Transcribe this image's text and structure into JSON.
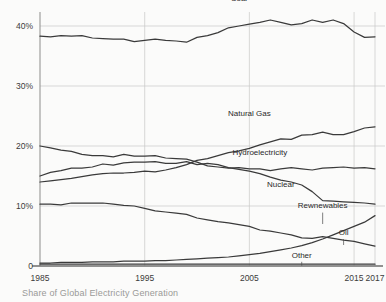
{
  "caption": "Share of Global Electricity Generation",
  "chart_data": {
    "type": "line",
    "title": "",
    "subtitle": "",
    "caption": "Share of Global Electricity Generation",
    "xlabel": "",
    "ylabel": "",
    "xlim": [
      1985,
      2017
    ],
    "ylim": [
      0,
      42
    ],
    "grid": true,
    "legend_position": "inline-labels",
    "y_ticks": [
      {
        "value": 0,
        "label": "0"
      },
      {
        "value": 10,
        "label": "10%"
      },
      {
        "value": 20,
        "label": "20%"
      },
      {
        "value": 30,
        "label": "30%"
      },
      {
        "value": 40,
        "label": "40%"
      }
    ],
    "x_ticks": [
      {
        "value": 1985,
        "label": "1985"
      },
      {
        "value": 1995,
        "label": "1995"
      },
      {
        "value": 2005,
        "label": "2005"
      },
      {
        "value": 2015,
        "label": "2015"
      },
      {
        "value": 2017,
        "label": "2017"
      }
    ],
    "x": [
      1985,
      1986,
      1987,
      1988,
      1989,
      1990,
      1991,
      1992,
      1993,
      1994,
      1995,
      1996,
      1997,
      1998,
      1999,
      2000,
      2001,
      2002,
      2003,
      2004,
      2005,
      2006,
      2007,
      2008,
      2009,
      2010,
      2011,
      2012,
      2013,
      2014,
      2015,
      2016,
      2017
    ],
    "series": [
      {
        "name": "Coal",
        "label": "Coal",
        "label_x": 2004,
        "label_y": 44.2,
        "color": "#3a3a3a",
        "values": [
          38.3,
          38.2,
          38.4,
          38.3,
          38.4,
          38.0,
          37.9,
          37.8,
          37.8,
          37.4,
          37.6,
          37.8,
          37.6,
          37.5,
          37.3,
          38.1,
          38.4,
          38.9,
          39.7,
          40.0,
          40.3,
          40.6,
          41.0,
          40.6,
          40.2,
          40.4,
          41.0,
          40.6,
          41.0,
          40.4,
          39.0,
          38.1,
          38.2
        ],
        "endpoint": {
          "year": 2017,
          "value": 38.2
        }
      },
      {
        "name": "Natural Gas",
        "label": "Natural Gas",
        "label_x": 2005,
        "label_y": 25.0,
        "color": "#3a3a3a",
        "values": [
          14.0,
          14.2,
          14.4,
          14.6,
          14.9,
          15.2,
          15.4,
          15.5,
          15.5,
          15.6,
          15.8,
          15.7,
          16.0,
          16.4,
          16.9,
          17.6,
          17.9,
          18.4,
          18.9,
          19.2,
          19.6,
          20.2,
          20.7,
          21.2,
          21.1,
          21.8,
          21.9,
          22.3,
          21.9,
          21.9,
          22.4,
          23.0,
          23.2
        ],
        "endpoint": {
          "year": 2017,
          "value": 23.2
        }
      },
      {
        "name": "Hydroelectricity",
        "label": "Hydroelectricity",
        "label_x": 2006,
        "label_y": 18.5,
        "color": "#3a3a3a",
        "values": [
          20.0,
          19.7,
          19.3,
          19.1,
          18.6,
          18.4,
          18.4,
          18.2,
          18.6,
          18.3,
          18.3,
          18.4,
          18.0,
          17.9,
          17.8,
          17.3,
          16.7,
          16.5,
          16.3,
          16.4,
          16.2,
          16.2,
          15.9,
          16.2,
          16.4,
          16.2,
          16.0,
          16.3,
          16.4,
          16.5,
          16.3,
          16.4,
          16.2
        ],
        "endpoint": {
          "year": 2017,
          "value": 16.2
        }
      },
      {
        "name": "Nuclear",
        "label": "Nuclear",
        "label_x": 2008,
        "label_y": 13.2,
        "color": "#3a3a3a",
        "values": [
          15.0,
          15.6,
          15.9,
          16.3,
          16.3,
          16.5,
          17.0,
          16.8,
          17.2,
          17.3,
          17.3,
          17.4,
          17.1,
          17.1,
          17.4,
          16.9,
          17.1,
          16.9,
          16.4,
          16.1,
          15.8,
          15.4,
          14.8,
          14.3,
          14.0,
          13.5,
          12.4,
          10.9,
          10.8,
          10.7,
          10.6,
          10.5,
          10.3
        ],
        "endpoint": {
          "year": 2017,
          "value": 10.3
        }
      },
      {
        "name": "Oil",
        "label": "Oil",
        "label_x": 2014,
        "label_y": 5.2,
        "color": "#3a3a3a",
        "values": [
          10.3,
          10.3,
          10.2,
          10.5,
          10.5,
          10.5,
          10.5,
          10.3,
          10.1,
          10.0,
          9.6,
          9.2,
          9.0,
          8.8,
          8.6,
          8.0,
          7.7,
          7.4,
          7.2,
          6.9,
          6.6,
          6.0,
          5.8,
          5.5,
          5.2,
          4.7,
          4.6,
          4.9,
          4.6,
          4.3,
          4.1,
          3.7,
          3.3
        ],
        "endpoint": {
          "year": 2017,
          "value": 3.3
        }
      },
      {
        "name": "Rewnewables",
        "label": "Rewnewables",
        "label_x": 2012,
        "label_y": 9.6,
        "color": "#3a3a3a",
        "values": [
          0.5,
          0.5,
          0.6,
          0.6,
          0.6,
          0.7,
          0.7,
          0.7,
          0.8,
          0.8,
          0.8,
          0.9,
          0.9,
          1.0,
          1.1,
          1.2,
          1.3,
          1.4,
          1.5,
          1.7,
          1.9,
          2.1,
          2.4,
          2.7,
          3.0,
          3.4,
          3.9,
          4.5,
          5.2,
          5.9,
          6.6,
          7.3,
          8.4
        ],
        "endpoint": {
          "year": 2017,
          "value": 8.4
        }
      },
      {
        "name": "Other",
        "label": "Other",
        "label_x": 2010,
        "label_y": 1.3,
        "color": "#3a3a3a",
        "values": [
          0.3,
          0.3,
          0.3,
          0.3,
          0.3,
          0.3,
          0.3,
          0.3,
          0.3,
          0.3,
          0.3,
          0.3,
          0.3,
          0.3,
          0.3,
          0.3,
          0.3,
          0.3,
          0.3,
          0.3,
          0.3,
          0.3,
          0.3,
          0.3,
          0.3,
          0.3,
          0.3,
          0.3,
          0.3,
          0.3,
          0.3,
          0.3,
          0.3
        ],
        "endpoint": {
          "year": 2017,
          "value": 0.3
        }
      }
    ]
  }
}
